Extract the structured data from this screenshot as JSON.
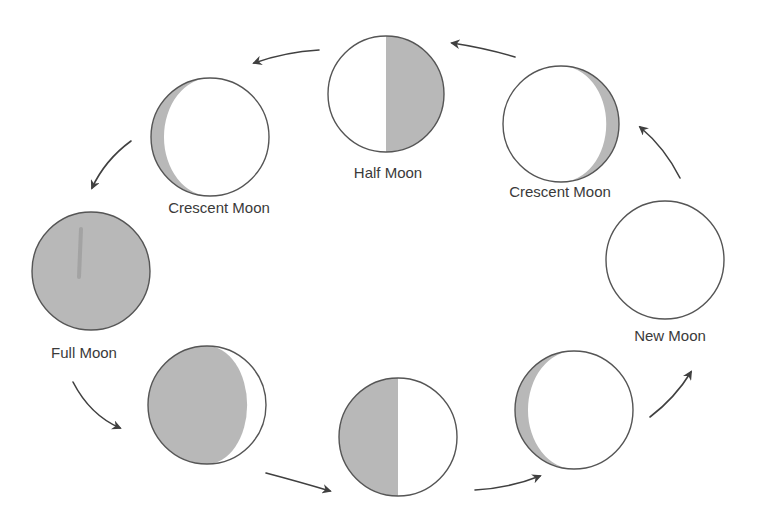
{
  "diagram": {
    "type": "moon-phase-cycle",
    "colors": {
      "background": "#ffffff",
      "shadow": "#b8b8b8",
      "lit": "#ffffff",
      "outline": "#555555",
      "arrow": "#404040",
      "label": "#3a3a3a"
    },
    "moons": [
      {
        "id": "half-moon-top",
        "label": "Half Moon",
        "cx": 386,
        "cy": 94,
        "r": 58,
        "shadow": "right-half",
        "label_x": 388,
        "label_y": 165
      },
      {
        "id": "crescent-moon-left",
        "label": "Crescent Moon",
        "cx": 210,
        "cy": 137,
        "r": 59,
        "shadow": "left-crescent",
        "label_x": 219,
        "label_y": 200
      },
      {
        "id": "full-moon",
        "label": "Full Moon",
        "cx": 91,
        "cy": 271,
        "r": 59,
        "shadow": "full",
        "label_x": 84,
        "label_y": 345
      },
      {
        "id": "gibbous-moon-bottom-left",
        "label": "",
        "cx": 207,
        "cy": 405,
        "r": 59,
        "shadow": "left-gibbous"
      },
      {
        "id": "half-moon-bottom",
        "label": "",
        "cx": 398,
        "cy": 437,
        "r": 59,
        "shadow": "left-half"
      },
      {
        "id": "crescent-moon-bottom-right",
        "label": "",
        "cx": 574,
        "cy": 410,
        "r": 59,
        "shadow": "left-crescent"
      },
      {
        "id": "new-moon",
        "label": "New Moon",
        "cx": 665,
        "cy": 260,
        "r": 59,
        "shadow": "none",
        "label_x": 670,
        "label_y": 328
      },
      {
        "id": "crescent-moon-right",
        "label": "Crescent Moon",
        "cx": 561,
        "cy": 124,
        "r": 58,
        "shadow": "right-crescent",
        "label_x": 560,
        "label_y": 184
      }
    ],
    "arrows": [
      {
        "id": "arrow-half-to-left-crescent",
        "from": [
          319,
          50
        ],
        "ctrl": [
          285,
          52
        ],
        "to": [
          254,
          63
        ]
      },
      {
        "id": "arrow-right-crescent-to-half",
        "from": [
          515,
          57
        ],
        "ctrl": [
          485,
          48
        ],
        "to": [
          452,
          43
        ]
      },
      {
        "id": "arrow-new-to-right-crescent",
        "from": [
          680,
          178
        ],
        "ctrl": [
          665,
          148
        ],
        "to": [
          640,
          127
        ]
      },
      {
        "id": "arrow-left-crescent-to-full",
        "from": [
          131,
          141
        ],
        "ctrl": [
          105,
          160
        ],
        "to": [
          92,
          188
        ]
      },
      {
        "id": "arrow-full-to-gibbous",
        "from": [
          73,
          382
        ],
        "ctrl": [
          90,
          415
        ],
        "to": [
          120,
          428
        ]
      },
      {
        "id": "arrow-gibbous-to-bottom-half",
        "from": [
          266,
          473
        ],
        "ctrl": [
          300,
          482
        ],
        "to": [
          330,
          491
        ]
      },
      {
        "id": "arrow-bottom-half-to-crescent",
        "from": [
          475,
          490
        ],
        "ctrl": [
          510,
          488
        ],
        "to": [
          540,
          476
        ]
      },
      {
        "id": "arrow-crescent-to-new",
        "from": [
          650,
          417
        ],
        "ctrl": [
          675,
          398
        ],
        "to": [
          691,
          372
        ]
      }
    ]
  }
}
